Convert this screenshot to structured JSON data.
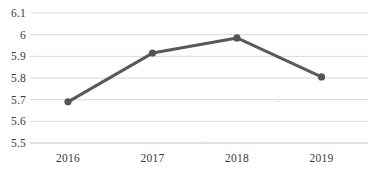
{
  "chart_data": {
    "type": "line",
    "title": "",
    "subtitle": "",
    "xlabel": "",
    "ylabel": "",
    "categories": [
      "2016",
      "2017",
      "2018",
      "2019"
    ],
    "values": [
      5.69,
      5.915,
      5.985,
      5.805
    ],
    "series": [
      {
        "name": "series-1",
        "values": [
          5.69,
          5.915,
          5.985,
          5.805
        ]
      }
    ],
    "ylim": [
      5.5,
      6.1
    ],
    "ytick_labels": [
      "6.1",
      "6",
      "5.9",
      "5.8",
      "5.7",
      "5.6",
      "5.5"
    ],
    "ytick_values": [
      6.1,
      6.0,
      5.9,
      5.8,
      5.7,
      5.6,
      5.5
    ],
    "xtick_labels": [
      "2016",
      "2017",
      "2018",
      "2019"
    ],
    "grid": "horizontal",
    "legend": "none",
    "annotations": []
  },
  "style": {
    "line_color": "#595959",
    "marker_color": "#545454",
    "grid_color": "#d8d8d8",
    "axis_color": "#c9c9c9",
    "background": "#ffffff",
    "text_color": "#3a3a3a"
  }
}
